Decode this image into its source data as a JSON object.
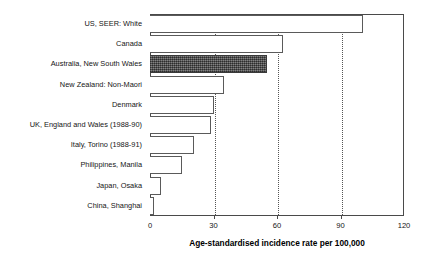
{
  "chart_data": {
    "type": "bar",
    "orientation": "horizontal",
    "title": "",
    "xlabel": "Age-standardised incidence rate per 100,000",
    "ylabel": "",
    "xlim": [
      0,
      120
    ],
    "xticks": [
      0,
      30,
      60,
      90,
      120
    ],
    "xtick_labels": [
      "0",
      "30",
      "60",
      "90",
      "120"
    ],
    "grid": true,
    "grid_axis": "x",
    "grid_style": "dotted",
    "legend": null,
    "categories": [
      "US, SEER: White",
      "Canada",
      "Australia, New South Wales",
      "New Zealand: Non-Maori",
      "Denmark",
      "UK, England and Wales (1988-90)",
      "Italy, Torino (1988-91)",
      "Philippines, Manila",
      "Japan, Osaka",
      "China, Shanghai"
    ],
    "values": [
      100.5,
      63,
      55.5,
      35,
      30,
      29,
      21,
      15,
      5,
      2
    ],
    "highlighted_category": "Australia, New South Wales",
    "bar_fill_default": "#ffffff",
    "bar_fill_highlight": "#565656",
    "bar_edge_color": "#5a5a5a"
  },
  "axis": {
    "title": "Age-standardised incidence rate per 100,000"
  }
}
